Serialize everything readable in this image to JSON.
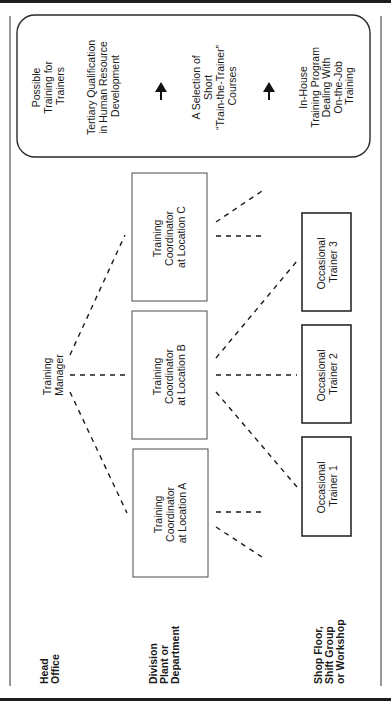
{
  "diagram": {
    "orientation": "rotated-90-ccw",
    "levels": {
      "head_office": [
        "Head",
        "Office"
      ],
      "division": [
        "Division",
        "Plant or",
        "Department"
      ],
      "shop_floor": [
        "Shop Floor,",
        "Shift Group",
        "or Workshop"
      ]
    },
    "manager": [
      "Training",
      "Manager"
    ],
    "coordinators": [
      {
        "id": "A",
        "lines": [
          "Training",
          "Coordinator",
          "at Location A"
        ]
      },
      {
        "id": "B",
        "lines": [
          "Training",
          "Coordinator",
          "at Location B"
        ]
      },
      {
        "id": "C",
        "lines": [
          "Training",
          "Coordinator",
          "at Location C"
        ]
      }
    ],
    "trainers": [
      {
        "id": "1",
        "lines": [
          "Occasional",
          "Trainer 1"
        ]
      },
      {
        "id": "2",
        "lines": [
          "Occasional",
          "Trainer 2"
        ]
      },
      {
        "id": "3",
        "lines": [
          "Occasional",
          "Trainer 3"
        ]
      }
    ],
    "training_panel": {
      "title": [
        "Possible",
        "Training for",
        "Trainers"
      ],
      "tertiary": [
        "Tertiary Qualification",
        "in Human Resource",
        "Development"
      ],
      "short_courses": [
        "A Selection of",
        "Short",
        "“Train-the-Trainer”",
        "Courses"
      ],
      "in_house": [
        "In-House",
        "Training Program",
        "Dealing With",
        "On-the-Job",
        "Training"
      ]
    },
    "colors": {
      "line": "#1a1a1a",
      "box_border": "#4a4a4a",
      "background": "#ffffff"
    }
  }
}
